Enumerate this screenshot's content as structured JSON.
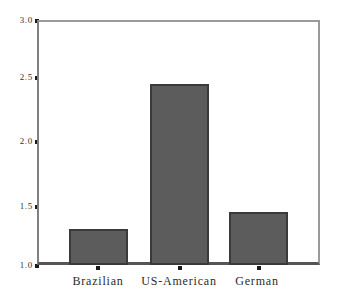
{
  "chart_data": {
    "type": "bar",
    "title": "",
    "subtitle": "",
    "xlabel": "",
    "ylabel": "",
    "categories": [
      "Brazilian",
      "US-American",
      "German"
    ],
    "values": [
      1.29,
      2.48,
      1.43
    ],
    "series": [
      {
        "name": "",
        "values": [
          1.29,
          2.48,
          1.43
        ]
      }
    ],
    "ylim": [
      1.0,
      3.0
    ],
    "yticks": [
      1.0,
      1.5,
      2.0,
      2.5,
      3.0
    ],
    "ytick_labels": [
      "1.0",
      "1.5",
      "2.0",
      "2.5",
      "3.0"
    ],
    "grid": false,
    "legend": false,
    "legend_position": "none",
    "bar_color": "#5c5c5c",
    "bar_edge_color": "#3a3a3a",
    "axis_color": "#808080",
    "background_color": "#ffffff",
    "annotations": []
  }
}
